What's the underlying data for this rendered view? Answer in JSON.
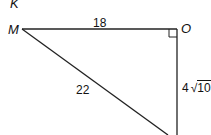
{
  "diagram": {
    "type": "right-triangle",
    "vertices": {
      "top_left_label": "K",
      "left": "M",
      "right_angle": "O"
    },
    "sides": {
      "MO": "18",
      "hypotenuse": "22",
      "vertical_coef": "4",
      "vertical_radicand": "10"
    },
    "right_angle_at": "O"
  }
}
